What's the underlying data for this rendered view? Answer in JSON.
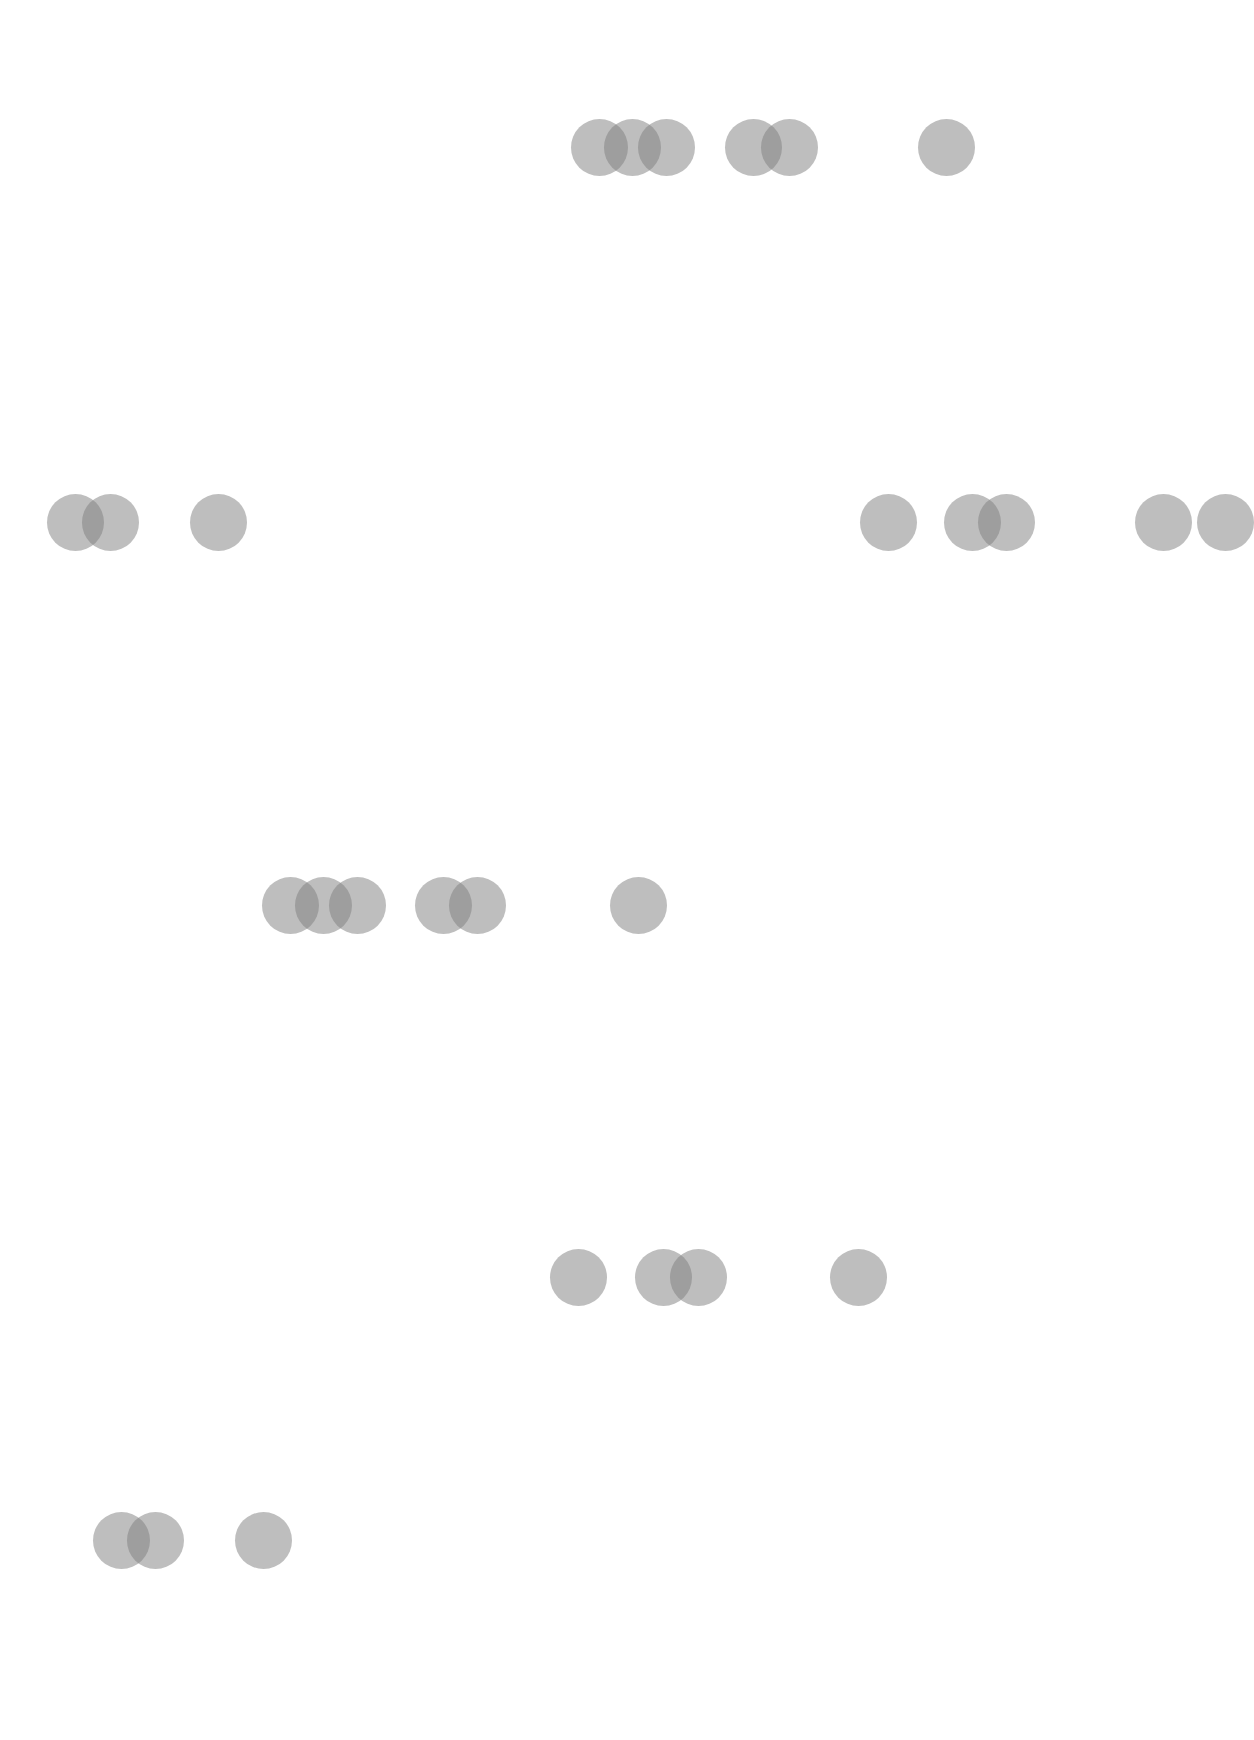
{
  "style": {
    "background": "#ffffff",
    "circle_color": "rgba(125,125,125,0.5)",
    "circle_diameter": 57
  },
  "rows": [
    {
      "y": 147,
      "circles_x": [
        599,
        632,
        666,
        753,
        789,
        946
      ]
    },
    {
      "y": 522,
      "circles_x": [
        75,
        110,
        218,
        888,
        972,
        1006,
        1163,
        1225
      ]
    },
    {
      "y": 905,
      "circles_x": [
        290,
        323,
        357,
        443,
        477,
        638
      ]
    },
    {
      "y": 1277,
      "circles_x": [
        578,
        663,
        698,
        858
      ]
    },
    {
      "y": 1540,
      "circles_x": [
        121,
        155,
        263
      ]
    }
  ]
}
